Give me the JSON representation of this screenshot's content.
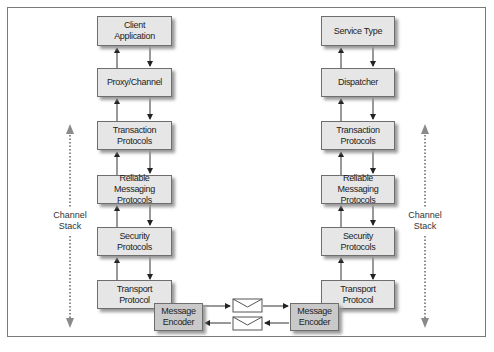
{
  "diagram": {
    "left_stack": {
      "boxes": [
        {
          "label": "Client\nApplication"
        },
        {
          "label": "Proxy/Channel"
        },
        {
          "label": "Transaction\nProtocols"
        },
        {
          "label": "Reliable Messaging\nProtocols"
        },
        {
          "label": "Security\nProtocols"
        },
        {
          "label": "Transport\nProtocol"
        }
      ],
      "encoder": {
        "label": "Message\nEncoder"
      },
      "stack_label": "Channel\nStack"
    },
    "right_stack": {
      "boxes": [
        {
          "label": "Service Type"
        },
        {
          "label": "Dispatcher"
        },
        {
          "label": "Transaction\nProtocols"
        },
        {
          "label": "Reliable Messaging\nProtocols"
        },
        {
          "label": "Security\nProtocols"
        },
        {
          "label": "Transport\nProtocol"
        }
      ],
      "encoder": {
        "label": "Message\nEncoder"
      },
      "stack_label": "Channel\nStack"
    },
    "messages": [
      {
        "direction": "left-to-right",
        "icon": "envelope-icon"
      },
      {
        "direction": "right-to-left",
        "icon": "envelope-icon"
      }
    ],
    "colors": {
      "box_fill": "#e6e6e6",
      "encoder_fill": "#c9c9c9",
      "border": "#6e6e6e",
      "arrow": "#333333",
      "stack_arrow": "#8a8a8a"
    }
  }
}
